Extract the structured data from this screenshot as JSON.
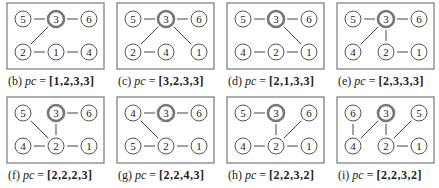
{
  "figure": {
    "node_radius": 8,
    "root_node": "3",
    "colors": {
      "border": "#777777",
      "edge": "#444444",
      "node_stroke": "#555555",
      "root_stroke": "#777777",
      "text": "#222222"
    },
    "panels": [
      {
        "id": "b",
        "caption_tag": "(b)",
        "caption_var": "pc",
        "caption_eq": "=",
        "caption_vec": "[1,2,3,3]",
        "nodes": [
          {
            "label": "5",
            "x": 17,
            "y": 17
          },
          {
            "label": "3",
            "x": 50,
            "y": 17
          },
          {
            "label": "6",
            "x": 83,
            "y": 17
          },
          {
            "label": "2",
            "x": 17,
            "y": 50
          },
          {
            "label": "1",
            "x": 50,
            "y": 50
          },
          {
            "label": "4",
            "x": 83,
            "y": 50
          }
        ],
        "edges": [
          [
            "5",
            "3"
          ],
          [
            "3",
            "6"
          ],
          [
            "3",
            "2"
          ],
          [
            "2",
            "1"
          ],
          [
            "1",
            "4"
          ]
        ]
      },
      {
        "id": "c",
        "caption_tag": "(c)",
        "caption_var": "pc",
        "caption_eq": "=",
        "caption_vec": "[3,2,3,3]",
        "nodes": [
          {
            "label": "5",
            "x": 17,
            "y": 17
          },
          {
            "label": "3",
            "x": 50,
            "y": 17
          },
          {
            "label": "6",
            "x": 83,
            "y": 17
          },
          {
            "label": "2",
            "x": 17,
            "y": 50
          },
          {
            "label": "4",
            "x": 50,
            "y": 50
          },
          {
            "label": "1",
            "x": 83,
            "y": 50
          }
        ],
        "edges": [
          [
            "5",
            "3"
          ],
          [
            "3",
            "6"
          ],
          [
            "3",
            "2"
          ],
          [
            "3",
            "1"
          ],
          [
            "2",
            "4"
          ]
        ]
      },
      {
        "id": "d",
        "caption_tag": "(d)",
        "caption_var": "pc",
        "caption_eq": "=",
        "caption_vec": "[2,1,3,3]",
        "nodes": [
          {
            "label": "5",
            "x": 17,
            "y": 17
          },
          {
            "label": "3",
            "x": 50,
            "y": 17
          },
          {
            "label": "6",
            "x": 83,
            "y": 17
          },
          {
            "label": "4",
            "x": 17,
            "y": 50
          },
          {
            "label": "2",
            "x": 50,
            "y": 50
          },
          {
            "label": "1",
            "x": 83,
            "y": 50
          }
        ],
        "edges": [
          [
            "5",
            "3"
          ],
          [
            "3",
            "6"
          ],
          [
            "3",
            "1"
          ],
          [
            "4",
            "2"
          ],
          [
            "2",
            "1"
          ]
        ]
      },
      {
        "id": "e",
        "caption_tag": "(e)",
        "caption_var": "pc",
        "caption_eq": "=",
        "caption_vec": "[2,3,3,3]",
        "nodes": [
          {
            "label": "5",
            "x": 17,
            "y": 17
          },
          {
            "label": "3",
            "x": 50,
            "y": 17
          },
          {
            "label": "6",
            "x": 83,
            "y": 17
          },
          {
            "label": "4",
            "x": 17,
            "y": 50
          },
          {
            "label": "2",
            "x": 50,
            "y": 50
          },
          {
            "label": "1",
            "x": 83,
            "y": 50
          }
        ],
        "edges": [
          [
            "5",
            "3"
          ],
          [
            "3",
            "6"
          ],
          [
            "3",
            "4"
          ],
          [
            "3",
            "2"
          ],
          [
            "2",
            "1"
          ]
        ]
      },
      {
        "id": "f",
        "caption_tag": "(f)",
        "caption_var": "pc",
        "caption_eq": "=",
        "caption_vec": "[2,2,2,3]",
        "nodes": [
          {
            "label": "5",
            "x": 17,
            "y": 17
          },
          {
            "label": "3",
            "x": 50,
            "y": 17
          },
          {
            "label": "6",
            "x": 83,
            "y": 17
          },
          {
            "label": "4",
            "x": 17,
            "y": 50
          },
          {
            "label": "2",
            "x": 50,
            "y": 50
          },
          {
            "label": "1",
            "x": 83,
            "y": 50
          }
        ],
        "edges": [
          [
            "3",
            "6"
          ],
          [
            "5",
            "2"
          ],
          [
            "3",
            "2"
          ],
          [
            "4",
            "2"
          ],
          [
            "2",
            "1"
          ]
        ]
      },
      {
        "id": "g",
        "caption_tag": "(g)",
        "caption_var": "pc",
        "caption_eq": "=",
        "caption_vec": "[2,2,4,3]",
        "nodes": [
          {
            "label": "4",
            "x": 17,
            "y": 17
          },
          {
            "label": "3",
            "x": 50,
            "y": 17
          },
          {
            "label": "6",
            "x": 83,
            "y": 17
          },
          {
            "label": "5",
            "x": 17,
            "y": 50
          },
          {
            "label": "2",
            "x": 50,
            "y": 50
          },
          {
            "label": "1",
            "x": 83,
            "y": 50
          }
        ],
        "edges": [
          [
            "4",
            "3"
          ],
          [
            "3",
            "6"
          ],
          [
            "4",
            "2"
          ],
          [
            "5",
            "2"
          ],
          [
            "2",
            "1"
          ]
        ]
      },
      {
        "id": "h",
        "caption_tag": "(h)",
        "caption_var": "pc",
        "caption_eq": "=",
        "caption_vec": "[2,2,3,2]",
        "nodes": [
          {
            "label": "5",
            "x": 17,
            "y": 17
          },
          {
            "label": "3",
            "x": 50,
            "y": 17
          },
          {
            "label": "6",
            "x": 83,
            "y": 17
          },
          {
            "label": "4",
            "x": 17,
            "y": 50
          },
          {
            "label": "2",
            "x": 50,
            "y": 50
          },
          {
            "label": "1",
            "x": 83,
            "y": 50
          }
        ],
        "edges": [
          [
            "5",
            "3"
          ],
          [
            "3",
            "2"
          ],
          [
            "6",
            "2"
          ],
          [
            "4",
            "2"
          ],
          [
            "2",
            "1"
          ]
        ]
      },
      {
        "id": "i",
        "caption_tag": "(i)",
        "caption_var": "pc",
        "caption_eq": "=",
        "caption_vec": "[2,2,3,2]",
        "nodes": [
          {
            "label": "6",
            "x": 17,
            "y": 17
          },
          {
            "label": "3",
            "x": 50,
            "y": 17
          },
          {
            "label": "5",
            "x": 83,
            "y": 17
          },
          {
            "label": "4",
            "x": 17,
            "y": 50
          },
          {
            "label": "2",
            "x": 50,
            "y": 50
          },
          {
            "label": "1",
            "x": 83,
            "y": 50
          }
        ],
        "edges": [
          [
            "6",
            "4"
          ],
          [
            "3",
            "4"
          ],
          [
            "3",
            "2"
          ],
          [
            "5",
            "2"
          ],
          [
            "2",
            "1"
          ]
        ]
      }
    ]
  }
}
